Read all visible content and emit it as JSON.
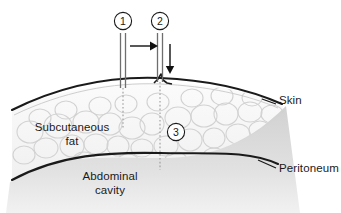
{
  "figure": {
    "background_color": "#ffffff",
    "line_color": "#1a1a1a",
    "fat_outline_color": "#cfcfcf",
    "fat_fill_color": "#f4f4f4",
    "cavity_fill_color": "#d9d9d9",
    "needle_color": "#808080"
  },
  "labels": {
    "skin": "Skin",
    "peritoneum": "Peritoneum",
    "subcutaneous_fat_line1": "Subcutaneous",
    "subcutaneous_fat_line2": "fat",
    "abdominal_cavity_line1": "Abdominal",
    "abdominal_cavity_line2": "cavity"
  },
  "callouts": [
    {
      "id": "callout-1",
      "number": "1",
      "cx": 123,
      "cy": 21,
      "r": 9
    },
    {
      "id": "callout-2",
      "number": "2",
      "cx": 160,
      "cy": 21,
      "r": 9
    },
    {
      "id": "callout-3",
      "number": "3",
      "cx": 176,
      "cy": 132,
      "r": 9
    }
  ],
  "needles": [
    {
      "id": "needle-1",
      "x": 123,
      "top": 33,
      "skin_y": 88,
      "track_end": 128
    },
    {
      "id": "needle-2",
      "x": 160,
      "top": 33,
      "skin_y": 82,
      "track_end": 168
    }
  ],
  "arrows": [
    {
      "id": "advance-arrow",
      "direction": "right",
      "x1": 130,
      "y1": 46,
      "x2": 153,
      "y2": 46
    },
    {
      "id": "insertion-arrow",
      "direction": "down",
      "x1": 170,
      "y1": 45,
      "x2": 170,
      "y2": 73
    }
  ],
  "layers": [
    {
      "id": "skin-layer",
      "name": "Skin"
    },
    {
      "id": "fat-layer",
      "name": "Subcutaneous fat"
    },
    {
      "id": "peritoneum-layer",
      "name": "Peritoneum"
    },
    {
      "id": "cavity-layer",
      "name": "Abdominal cavity"
    }
  ]
}
